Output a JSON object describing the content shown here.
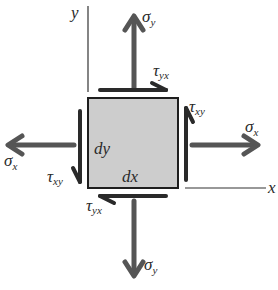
{
  "diagram": {
    "colors": {
      "element_fill": "#cdcdcd",
      "element_border": "#1e1e1e",
      "arrow": "#555555",
      "shear_arrow": "#2a2a2a",
      "axis": "#333333"
    },
    "axes": {
      "y_label": "y",
      "x_label": "x"
    },
    "element": {
      "width_label": "dx",
      "height_label": "dy"
    },
    "stresses": {
      "sigma_y_top": {
        "symbol": "σ",
        "sub": "y"
      },
      "sigma_y_bottom": {
        "symbol": "σ",
        "sub": "y"
      },
      "sigma_x_right": {
        "symbol": "σ",
        "sub": "x"
      },
      "sigma_x_left": {
        "symbol": "σ",
        "sub": "x"
      },
      "tau_yx_top": {
        "symbol": "τ",
        "sub": "yx"
      },
      "tau_yx_bottom": {
        "symbol": "τ",
        "sub": "yx"
      },
      "tau_xy_right": {
        "symbol": "τ",
        "sub": "xy"
      },
      "tau_xy_left": {
        "symbol": "τ",
        "sub": "xy"
      }
    }
  }
}
